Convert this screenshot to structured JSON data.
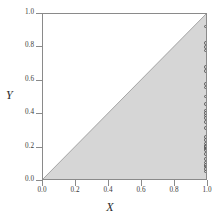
{
  "chart_data": {
    "type": "scatter",
    "title": "",
    "xlabel": "X",
    "ylabel": "Y",
    "xlim": [
      0.0,
      1.0
    ],
    "ylim": [
      0.0,
      1.0
    ],
    "grid": false,
    "legend": null,
    "xticks": [
      "0.0",
      "0.2",
      "0.4",
      "0.6",
      "0.8",
      "1.0"
    ],
    "xtickvals": [
      0.0,
      0.2,
      0.4,
      0.6,
      0.8,
      1.0
    ],
    "yticks": [
      "0.0",
      "0.2",
      "0.4",
      "0.6",
      "0.8",
      "1.0"
    ],
    "ytickvals": [
      0.0,
      0.2,
      0.4,
      0.6,
      0.8,
      1.0
    ],
    "shaded_region": {
      "name": "region-below-diagonal",
      "description": "Area where Y is less than or equal to X",
      "fill_color": "#d6d6d6",
      "boundary_line": "y = x",
      "boundary_color": "#6e6e6e",
      "vertices": [
        [
          0.0,
          0.0
        ],
        [
          1.0,
          0.0
        ],
        [
          1.0,
          1.0
        ]
      ]
    },
    "points": {
      "name": "data-points",
      "marker": "open-circle",
      "marker_edge_color": "#5a5a5a",
      "marker_face_color": "none",
      "x": [
        1.0,
        1.0,
        1.0,
        1.0,
        1.0,
        1.0,
        1.0,
        1.0,
        1.0,
        1.0,
        1.0,
        1.0,
        1.0,
        1.0,
        1.0,
        1.0,
        1.0,
        1.0,
        1.0,
        1.0,
        1.0,
        1.0,
        1.0,
        1.0,
        1.0,
        1.0,
        1.0,
        1.0,
        1.0,
        1.0
      ],
      "y": [
        0.925,
        0.825,
        0.8,
        0.78,
        0.68,
        0.655,
        0.575,
        0.555,
        0.5,
        0.455,
        0.415,
        0.4,
        0.385,
        0.37,
        0.345,
        0.31,
        0.255,
        0.235,
        0.215,
        0.2,
        0.195,
        0.185,
        0.175,
        0.15,
        0.12,
        0.1,
        0.085,
        0.075,
        0.06,
        0.045
      ]
    }
  },
  "colors": {
    "frame": "#8a8a8a",
    "shade": "#d6d6d6",
    "diagonal": "#6e6e6e",
    "tick_text": "#3a3a3a",
    "axis_label": "#2a2a2a",
    "background": "#ffffff"
  }
}
